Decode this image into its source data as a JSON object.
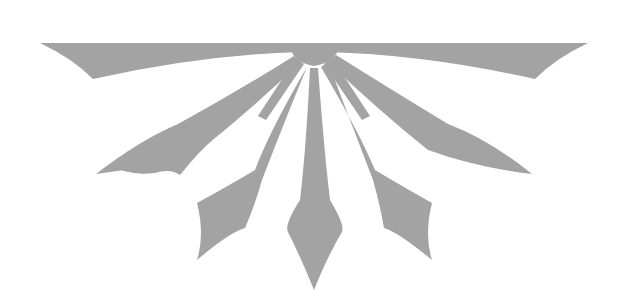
{
  "image": {
    "description": "Gray half-sunburst ornament with seven spear-tipped rays fanning downward from a flat top bar",
    "fill_color": "#a3a3a3",
    "background_color": "#ffffff",
    "ray_count": 7
  }
}
